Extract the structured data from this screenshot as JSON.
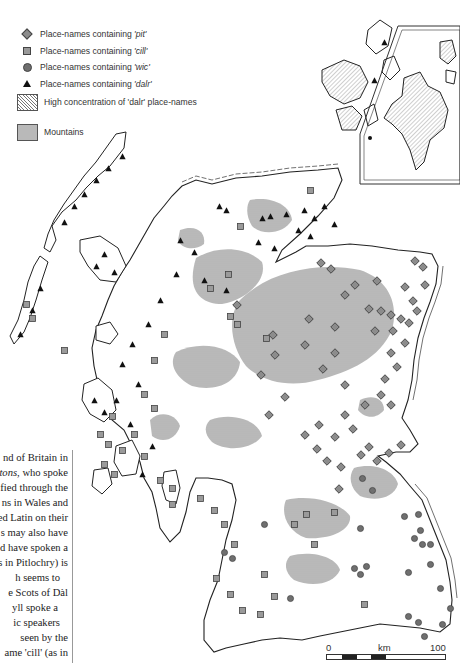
{
  "legend": {
    "items": [
      {
        "symbol": "diamond",
        "label": "Place-names containing ",
        "term": "'pit'"
      },
      {
        "symbol": "square",
        "label": "Place-names containing ",
        "term": "'cill'"
      },
      {
        "symbol": "circle",
        "label": "Place-names containing ",
        "term": "'wic'"
      },
      {
        "symbol": "triangle",
        "label": "Place-names containing ",
        "term": "'dalr'"
      }
    ],
    "areas": [
      {
        "pattern": "hatched",
        "label": "High concentration of 'dalr' place-names"
      },
      {
        "pattern": "stippled",
        "label": "Mountains"
      }
    ]
  },
  "text_box": {
    "lines": [
      "nd of Britain in",
      "tons, who spoke",
      "fied through the",
      "ns in Wales and",
      "ed Latin on their",
      "s may also have",
      "d have spoken a",
      "s in Pitlochry) is",
      "h seems to",
      "e Scots of Dàl",
      "yll spoke a",
      "ic speakers",
      "seen by the",
      "ame 'cill' (as in",
      "place with a",
      "",
      "ettled in eastern",
      "ts extend"
    ],
    "italic_fragment": "tons"
  },
  "scale": {
    "start": "0",
    "unit": "km",
    "end": "100"
  },
  "colors": {
    "pit": "#8c8c8c",
    "cill": "#999999",
    "wic": "#6f6f6f",
    "dalr": "#111111",
    "mountains": "#b9b9b9",
    "coast": "#222222"
  }
}
